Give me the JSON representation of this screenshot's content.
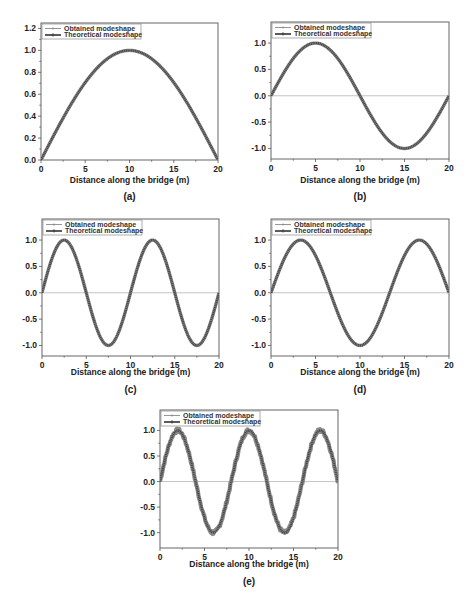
{
  "figure": {
    "colors": {
      "curve": "#4a4a4a",
      "obtained": "#8a8a8a",
      "zero_line": "#bdbdbd",
      "axis": "#555555",
      "background": "#ffffff"
    },
    "legend": [
      "Obtained modeshape",
      "Theoretical modeshape"
    ],
    "xlabel": "Distance along the bridge (m)"
  },
  "chart_data": [
    {
      "panel": "(a)",
      "type": "line",
      "mode_number": 1,
      "xlabel": "Distance along the bridge (m)",
      "ylabel": "",
      "xlim": [
        0,
        20
      ],
      "ylim": [
        0.0,
        1.25
      ],
      "xticks": [
        0,
        5,
        10,
        15,
        20
      ],
      "yticks": [
        0.0,
        0.2,
        0.4,
        0.6,
        0.8,
        1.0,
        1.2
      ],
      "ytick_labels": [
        "0.0",
        "0.2",
        "0.4",
        "0.6",
        "0.8",
        "1.0",
        "1.2"
      ],
      "zero_line": false,
      "legend": [
        "Obtained modeshape",
        "Theoretical modeshape"
      ],
      "legend_position": "upper left",
      "series": [
        {
          "name": "Obtained modeshape",
          "function": "sin(pi*x/20)",
          "x": [
            0,
            2.5,
            5,
            7.5,
            10,
            12.5,
            15,
            17.5,
            20
          ],
          "values": [
            0,
            0.383,
            0.707,
            0.924,
            1.0,
            0.924,
            0.707,
            0.383,
            0
          ]
        },
        {
          "name": "Theoretical modeshape",
          "function": "sin(pi*x/20)",
          "x": [
            0,
            2.5,
            5,
            7.5,
            10,
            12.5,
            15,
            17.5,
            20
          ],
          "values": [
            0,
            0.383,
            0.707,
            0.924,
            1.0,
            0.924,
            0.707,
            0.383,
            0
          ]
        }
      ],
      "box": {
        "x0": 41,
        "y0": 23,
        "x1": 218,
        "y1": 160
      },
      "caption_y": 200,
      "xlabel_y": 183
    },
    {
      "panel": "(b)",
      "type": "line",
      "mode_number": 2,
      "xlabel": "Distance along the bridge (m)",
      "ylabel": "",
      "xlim": [
        0,
        20
      ],
      "ylim": [
        -1.2,
        1.4
      ],
      "xticks": [
        0,
        5,
        10,
        15,
        20
      ],
      "yticks": [
        -1.0,
        -0.5,
        0.0,
        0.5,
        1.0
      ],
      "ytick_labels": [
        "-1.0",
        "-0.5",
        "0.0",
        "0.5",
        "1.0"
      ],
      "zero_line": true,
      "legend": [
        "Obtained modeshape",
        "Theoretical modeshape"
      ],
      "legend_position": "upper left",
      "series": [
        {
          "name": "Obtained modeshape",
          "function": "sin(2*pi*x/20)",
          "x": [
            0,
            5,
            10,
            15,
            20
          ],
          "values": [
            0,
            1.0,
            0,
            -1.0,
            0
          ]
        },
        {
          "name": "Theoretical modeshape",
          "function": "sin(2*pi*x/20)",
          "x": [
            0,
            5,
            10,
            15,
            20
          ],
          "values": [
            0,
            1.0,
            0,
            -1.0,
            0
          ]
        }
      ],
      "box": {
        "x0": 271,
        "y0": 22,
        "x1": 449,
        "y1": 159
      },
      "caption_y": 200,
      "xlabel_y": 183
    },
    {
      "panel": "(c)",
      "type": "line",
      "mode_number": 4,
      "xlabel": "Distance along the bridge (m)",
      "ylabel": "",
      "xlim": [
        0,
        20
      ],
      "ylim": [
        -1.2,
        1.4
      ],
      "xticks": [
        0,
        5,
        10,
        15,
        20
      ],
      "yticks": [
        -1.0,
        -0.5,
        0.0,
        0.5,
        1.0
      ],
      "ytick_labels": [
        "-1.0",
        "-0.5",
        "0.0",
        "0.5",
        "1.0"
      ],
      "zero_line": true,
      "legend": [
        "Obtained modeshape",
        "Theoretical modeshape"
      ],
      "legend_position": "upper left",
      "series": [
        {
          "name": "Obtained modeshape",
          "function": "sin(4*pi*x/20)",
          "x": [
            0,
            2.5,
            5,
            7.5,
            10,
            12.5,
            15,
            17.5,
            20
          ],
          "values": [
            0,
            1.0,
            0,
            -1.0,
            0,
            1.0,
            0,
            -1.0,
            0
          ]
        },
        {
          "name": "Theoretical modeshape",
          "function": "sin(4*pi*x/20)",
          "x": [
            0,
            2.5,
            5,
            7.5,
            10,
            12.5,
            15,
            17.5,
            20
          ],
          "values": [
            0,
            1.0,
            0,
            -1.0,
            0,
            1.0,
            0,
            -1.0,
            0
          ]
        }
      ],
      "box": {
        "x0": 42,
        "y0": 219,
        "x1": 219,
        "y1": 356
      },
      "caption_y": 393,
      "xlabel_y": 375
    },
    {
      "panel": "(d)",
      "type": "line",
      "mode_number": 3,
      "xlabel": "Distance along the bridge (m)",
      "ylabel": "",
      "xlim": [
        0,
        20
      ],
      "ylim": [
        -1.2,
        1.4
      ],
      "xticks": [
        0,
        5,
        10,
        15,
        20
      ],
      "yticks": [
        -1.0,
        -0.5,
        0.0,
        0.5,
        1.0
      ],
      "ytick_labels": [
        "-1.0",
        "-0.5",
        "0.0",
        "0.5",
        "1.0"
      ],
      "zero_line": true,
      "legend": [
        "Obtained modeshape",
        "Theoretical modeshape"
      ],
      "legend_position": "upper left",
      "series": [
        {
          "name": "Obtained modeshape",
          "function": "sin(3*pi*x/20)",
          "x": [
            0,
            3.33,
            6.67,
            10,
            13.33,
            16.67,
            20
          ],
          "values": [
            0,
            1.0,
            0,
            -1.0,
            0,
            1.0,
            0
          ]
        },
        {
          "name": "Theoretical modeshape",
          "function": "sin(3*pi*x/20)",
          "x": [
            0,
            3.33,
            6.67,
            10,
            13.33,
            16.67,
            20
          ],
          "values": [
            0,
            1.0,
            0,
            -1.0,
            0,
            1.0,
            0
          ]
        }
      ],
      "box": {
        "x0": 271,
        "y0": 219,
        "x1": 449,
        "y1": 356
      },
      "caption_y": 393,
      "xlabel_y": 375
    },
    {
      "panel": "(e)",
      "type": "line",
      "mode_number": 5,
      "xlabel": "Distance along the bridge (m)",
      "ylabel": "",
      "xlim": [
        0,
        20
      ],
      "ylim": [
        -1.3,
        1.4
      ],
      "xticks": [
        0,
        5,
        10,
        15,
        20
      ],
      "yticks": [
        -1.0,
        -0.5,
        0.0,
        0.5,
        1.0
      ],
      "ytick_labels": [
        "-1.0",
        "-0.5",
        "0.0",
        "0.5",
        "1.0"
      ],
      "zero_line": true,
      "legend": [
        "Obtained modeshape",
        "Theoretical modeshape"
      ],
      "legend_position": "upper left",
      "series": [
        {
          "name": "Obtained modeshape",
          "function": "sin(5*pi*x/20) with small noise",
          "x": [
            0,
            2,
            4,
            6,
            8,
            10,
            12,
            14,
            16,
            18,
            20
          ],
          "values": [
            0,
            1.0,
            0,
            -1.0,
            0,
            1.0,
            0,
            -1.0,
            0,
            1.0,
            0
          ]
        },
        {
          "name": "Theoretical modeshape",
          "function": "sin(5*pi*x/20)",
          "x": [
            0,
            2,
            4,
            6,
            8,
            10,
            12,
            14,
            16,
            18,
            20
          ],
          "values": [
            0,
            1.0,
            0,
            -1.0,
            0,
            1.0,
            0,
            -1.0,
            0,
            1.0,
            0
          ]
        }
      ],
      "box": {
        "x0": 160,
        "y0": 410,
        "x1": 338,
        "y1": 548
      },
      "caption_y": 585,
      "xlabel_y": 567
    }
  ]
}
